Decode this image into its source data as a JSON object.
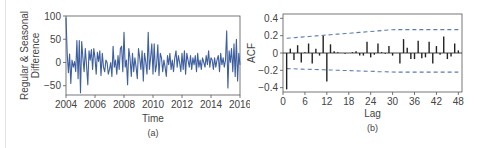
{
  "chart_data": [
    {
      "type": "line",
      "panel_label": "(a)",
      "title": "",
      "xlabel": "Time",
      "ylabel": "Regular & Seasonal Difference",
      "ylabel_lines": [
        "Regular & Seasonal",
        "Difference"
      ],
      "xlim": [
        2004,
        2016
      ],
      "ylim": [
        -70,
        100
      ],
      "xticks": [
        2004,
        2006,
        2008,
        2010,
        2012,
        2014,
        2016
      ],
      "yticks": [
        100,
        50,
        0,
        -50
      ],
      "line_color": "#3f5f9f",
      "grid": false,
      "x_start": 2004.0,
      "x_step": 0.0833,
      "values": [
        97,
        20,
        -22,
        18,
        -45,
        5,
        -10,
        2,
        -20,
        47,
        -35,
        47,
        -65,
        45,
        10,
        -20,
        30,
        -5,
        -48,
        25,
        5,
        28,
        -15,
        30,
        10,
        -25,
        22,
        2,
        25,
        -28,
        20,
        -10,
        -20,
        5,
        0,
        -25,
        -15,
        0,
        -30,
        35,
        -10,
        5,
        -25,
        15,
        -15,
        30,
        35,
        -20,
        65,
        -10,
        5,
        -48,
        30,
        10,
        -30,
        20,
        -20,
        10,
        -10,
        -35,
        30,
        10,
        -15,
        25,
        -40,
        20,
        0,
        -25,
        65,
        -15,
        10,
        40,
        -25,
        40,
        -20,
        -5,
        38,
        -28,
        20,
        10,
        -20,
        5,
        -10,
        -30,
        15,
        -5,
        20,
        -15,
        5,
        -20,
        10,
        25,
        -10,
        15,
        0,
        -20,
        20,
        -15,
        25,
        -25,
        20,
        5,
        -10,
        15,
        -15,
        10,
        -5,
        15,
        -20,
        20,
        -10,
        5,
        -15,
        10,
        0,
        -10,
        15,
        -5,
        25,
        -10,
        10,
        5,
        -15,
        10,
        -10,
        5,
        15,
        -20,
        20,
        -5,
        10,
        -10,
        5,
        68,
        -55,
        25,
        0,
        30,
        -20,
        40,
        -30,
        50,
        -40,
        20,
        -5
      ]
    },
    {
      "type": "bar",
      "subtype": "acf_stem",
      "panel_label": "(b)",
      "title": "",
      "xlabel": "Lag",
      "ylabel": "ACF",
      "xlim": [
        0,
        49
      ],
      "ylim": [
        -0.45,
        0.45
      ],
      "xticks": [
        0,
        6,
        12,
        18,
        24,
        30,
        36,
        42,
        48
      ],
      "yticks": [
        0.4,
        0.2,
        0,
        -0.2,
        -0.4
      ],
      "ytick_labels": [
        "0.4",
        "0.2",
        "0",
        "−0.2",
        "−0.4"
      ],
      "grid": false,
      "bar_color": "#222222",
      "lags": [
        1,
        2,
        3,
        4,
        5,
        6,
        7,
        8,
        9,
        10,
        11,
        12,
        13,
        14,
        15,
        16,
        17,
        18,
        19,
        20,
        21,
        22,
        23,
        24,
        25,
        26,
        27,
        28,
        29,
        30,
        31,
        32,
        33,
        34,
        35,
        36,
        37,
        38,
        39,
        40,
        41,
        42,
        43,
        44,
        45,
        46,
        47,
        48
      ],
      "values": [
        -0.42,
        0.05,
        -0.08,
        0.09,
        -0.11,
        0.01,
        0.11,
        -0.12,
        0.05,
        -0.03,
        0.2,
        -0.33,
        0.1,
        0.02,
        0.01,
        0.0,
        -0.01,
        0.0,
        0.01,
        0.02,
        -0.03,
        -0.03,
        0.13,
        -0.05,
        -0.02,
        0.11,
        0.01,
        -0.01,
        0.08,
        -0.03,
        0.0,
        -0.12,
        0.16,
        0.06,
        -0.07,
        -0.07,
        0.14,
        -0.06,
        -0.05,
        0.13,
        -0.12,
        0.08,
        -0.02,
        0.19,
        -0.07,
        -0.04,
        0.11,
        0.03
      ],
      "confidence_band": {
        "style": "dashed",
        "color": "#5a7bb5",
        "upper_start": 0.17,
        "upper_end": 0.27,
        "lower_start": -0.18,
        "lower_end": -0.22
      }
    }
  ]
}
